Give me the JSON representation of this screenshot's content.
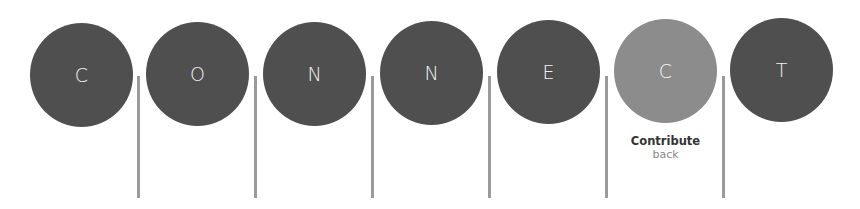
{
  "word": "CONNECT",
  "circles": [
    {
      "letter": "C",
      "style": "dark"
    },
    {
      "letter": "O",
      "style": "dark"
    },
    {
      "letter": "N",
      "style": "dark"
    },
    {
      "letter": "N",
      "style": "dark"
    },
    {
      "letter": "E",
      "style": "dark"
    },
    {
      "letter": "C",
      "style": "light",
      "caption": {
        "title": "Contribute",
        "subtitle": "back"
      }
    },
    {
      "letter": "T",
      "style": "dark"
    }
  ],
  "colors": {
    "dark_circle": "#4f4f4f",
    "highlight_circle": "#8c8c8c",
    "divider": "#9a9a9a",
    "letter": "#f2f2f2"
  }
}
